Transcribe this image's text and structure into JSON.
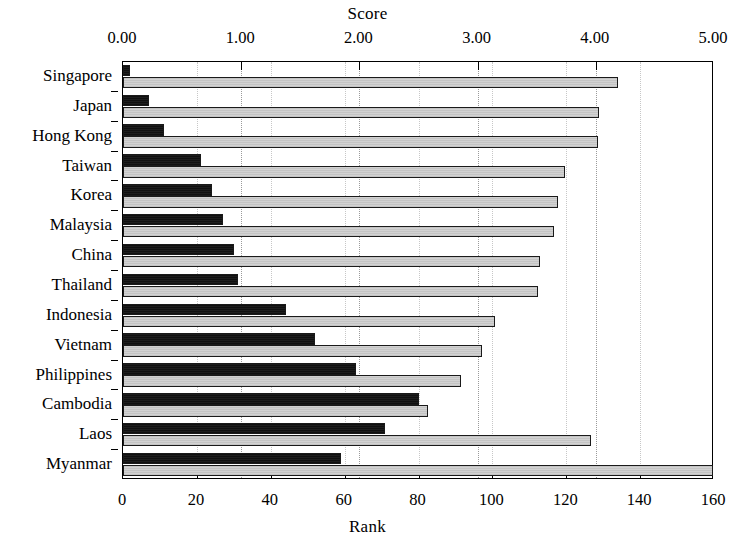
{
  "chart": {
    "top_axis_title": "Score",
    "bottom_axis_title": "Rank",
    "score_ticks": [
      "0.00",
      "1.00",
      "2.00",
      "3.00",
      "4.00",
      "5.00"
    ],
    "rank_ticks": [
      "0",
      "20",
      "40",
      "60",
      "80",
      "100",
      "120",
      "140",
      "160"
    ],
    "colors": {
      "rank_bar": "#141414",
      "score_bar": "#c9c9c9",
      "axis": "#000000",
      "gridline": "#9a9a9a",
      "background": "#ffffff"
    }
  },
  "chart_data": {
    "type": "bar",
    "orientation": "horizontal",
    "title": "",
    "categories": [
      "Singapore",
      "Japan",
      "Hong Kong",
      "Taiwan",
      "Korea",
      "Malaysia",
      "China",
      "Thailand",
      "Indonesia",
      "Vietnam",
      "Philippines",
      "Cambodia",
      "Laos",
      "Myanmar"
    ],
    "series": [
      {
        "name": "Rank",
        "axis": "bottom",
        "xlabel": "Rank",
        "xlim": [
          0,
          160
        ],
        "values": [
          2,
          7,
          11,
          21,
          24,
          27,
          30,
          31,
          44,
          52,
          63,
          80,
          71,
          59
        ]
      },
      {
        "name": "Score",
        "axis": "top",
        "xlabel": "Score",
        "xlim": [
          0,
          5
        ],
        "values": [
          4.19,
          4.03,
          4.02,
          3.74,
          3.68,
          3.65,
          3.53,
          3.51,
          3.15,
          3.04,
          2.86,
          2.58,
          3.96,
          5.02
        ]
      }
    ],
    "bottom_axis": {
      "label": "Rank",
      "min": 0,
      "max": 160,
      "step": 20
    },
    "top_axis": {
      "label": "Score",
      "min": 0,
      "max": 5,
      "step": 1,
      "tick_format": "0.00"
    },
    "grid": "vertical-dotted",
    "legend": "none"
  }
}
